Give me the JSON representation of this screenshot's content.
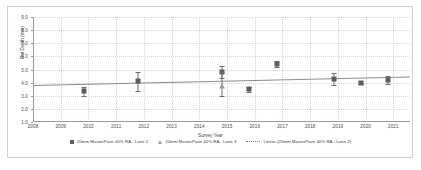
{
  "chart_data": {
    "type": "scatter",
    "title": "",
    "xlabel": "Survey Year",
    "ylabel": "Rut Depth (mm)",
    "xlim": [
      2008,
      2021.6
    ],
    "ylim": [
      1.0,
      9.0
    ],
    "grid": true,
    "legend_position": "bottom",
    "xticks": [
      "2008",
      "2009",
      "2010",
      "2011",
      "2012",
      "2013",
      "2014",
      "2015",
      "2016",
      "2017",
      "2018",
      "2019",
      "2020",
      "2021"
    ],
    "yticks": [
      "1.0",
      "2.0",
      "3.0",
      "4.0",
      "5.0",
      "6.0",
      "7.0",
      "8.0",
      "9.0"
    ],
    "series": [
      {
        "name": "20mm MasterPave 40% RA - Lane 2",
        "marker": "square",
        "color": "#5d5d5d",
        "points": [
          {
            "x": 2009.85,
            "y": 3.35,
            "err_low": 0.35,
            "err_high": 0.35
          },
          {
            "x": 2011.8,
            "y": 4.1,
            "err_low": 0.7,
            "err_high": 0.7
          },
          {
            "x": 2014.8,
            "y": 4.8,
            "err_low": 0.45,
            "err_high": 0.45
          },
          {
            "x": 2015.8,
            "y": 3.5,
            "err_low": 0.2,
            "err_high": 0.2
          },
          {
            "x": 2016.8,
            "y": 5.4,
            "err_low": 0.22,
            "err_high": 0.22
          },
          {
            "x": 2018.85,
            "y": 4.3,
            "err_low": 0.45,
            "err_high": 0.45
          },
          {
            "x": 2019.85,
            "y": 4.0,
            "err_low": 0.12,
            "err_high": 0.12
          },
          {
            "x": 2020.8,
            "y": 4.2,
            "err_low": 0.3,
            "err_high": 0.3
          }
        ]
      },
      {
        "name": "20mm MasterPave 40% RA - Lane 3",
        "marker": "triangle",
        "color": "#9b9b9b",
        "points": [
          {
            "x": 2014.8,
            "y": 3.72,
            "err_low": 0.75,
            "err_high": 1.1
          }
        ]
      },
      {
        "name": "Linear (20mm MasterPave 40% RA - Lane 2)",
        "marker": "line",
        "color": "#8c8c8c",
        "trend": {
          "x0": 2008.0,
          "y0": 3.8,
          "x1": 2021.6,
          "y1": 4.45
        }
      }
    ]
  },
  "legend": {
    "items": [
      {
        "label": "20mm MasterPave 40% RA - Lane 2"
      },
      {
        "label": "20mm MasterPave 40% RA - Lane 3"
      },
      {
        "label": "Linear (20mm MasterPave 40% RA - Lane 2)"
      }
    ]
  }
}
